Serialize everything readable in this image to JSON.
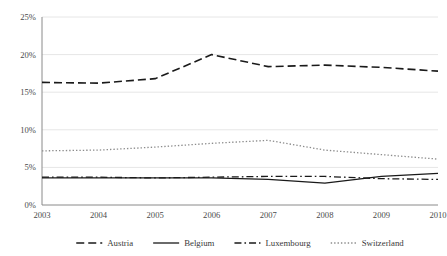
{
  "chart_data": {
    "type": "line",
    "title": "",
    "xlabel": "",
    "ylabel": "",
    "x": [
      2003,
      2004,
      2005,
      2006,
      2007,
      2008,
      2009,
      2010
    ],
    "categories": [
      "2003",
      "2004",
      "2005",
      "2006",
      "2007",
      "2008",
      "2009",
      "2010"
    ],
    "ylim": [
      0,
      25
    ],
    "yticks": [
      0,
      5,
      10,
      15,
      20,
      25
    ],
    "ytick_labels": [
      "0%",
      "5%",
      "10%",
      "15%",
      "20%",
      "25%"
    ],
    "grid": "horizontal",
    "legend_position": "bottom",
    "series": [
      {
        "name": "Austria",
        "style": "dashed",
        "color": "#1a1a1a",
        "values": [
          16.3,
          16.2,
          16.8,
          20.0,
          18.4,
          18.6,
          18.3,
          17.8
        ]
      },
      {
        "name": "Belgium",
        "style": "solid",
        "color": "#1a1a1a",
        "values": [
          3.6,
          3.6,
          3.6,
          3.6,
          3.4,
          2.9,
          3.8,
          4.2
        ]
      },
      {
        "name": "Luxembourg",
        "style": "dash-dot",
        "color": "#1a1a1a",
        "values": [
          3.7,
          3.7,
          3.6,
          3.7,
          3.8,
          3.8,
          3.5,
          3.4
        ]
      },
      {
        "name": "Switzerland",
        "style": "dotted",
        "color": "#8c8c8c",
        "values": [
          7.2,
          7.3,
          7.7,
          8.2,
          8.6,
          7.3,
          6.7,
          6.1
        ]
      }
    ]
  },
  "axes": {
    "axis_color": "#8a8a8a",
    "grid_color": "#e6e6e6"
  }
}
